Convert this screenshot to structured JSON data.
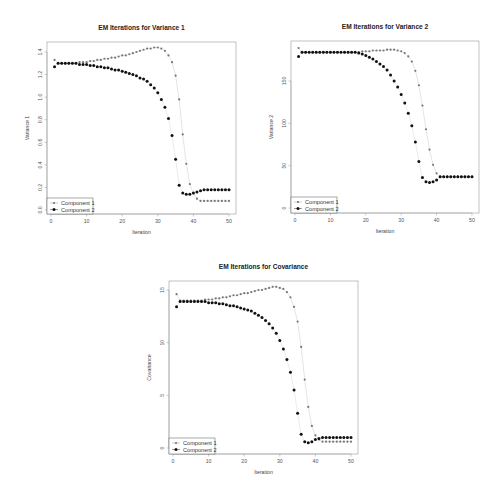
{
  "page": {
    "corner_mark": ""
  },
  "chart_data": [
    {
      "id": "variance1",
      "type": "scatter",
      "title": "EM Iterations for Variance 1",
      "xlabel": "Iteration",
      "ylabel": "Variance 1",
      "xlim": [
        0,
        50
      ],
      "ylim": [
        0.0,
        1.45
      ],
      "xticks": [
        0,
        10,
        20,
        30,
        40,
        50
      ],
      "yticks": [
        0.0,
        0.2,
        0.4,
        0.6,
        0.8,
        1.0,
        1.2,
        1.4
      ],
      "ytick_labels": [
        "0.0",
        "0.2",
        "0.4",
        "0.6",
        "0.8",
        "1.0",
        "1.2",
        "1.4"
      ],
      "grid": false,
      "legend_position": "bottom-left",
      "x": [
        1,
        2,
        3,
        4,
        5,
        6,
        7,
        8,
        9,
        10,
        11,
        12,
        13,
        14,
        15,
        16,
        17,
        18,
        19,
        20,
        21,
        22,
        23,
        24,
        25,
        26,
        27,
        28,
        29,
        30,
        31,
        32,
        33,
        34,
        35,
        36,
        37,
        38,
        39,
        40,
        41,
        42,
        43,
        44,
        45,
        46,
        47,
        48,
        49,
        50
      ],
      "series": [
        {
          "name": "Component 1",
          "color": "#777777",
          "marker_size": 1.1,
          "values": [
            1.33,
            1.3,
            1.3,
            1.3,
            1.3,
            1.3,
            1.3,
            1.31,
            1.31,
            1.31,
            1.32,
            1.32,
            1.33,
            1.33,
            1.34,
            1.34,
            1.35,
            1.35,
            1.36,
            1.37,
            1.37,
            1.38,
            1.39,
            1.4,
            1.41,
            1.42,
            1.43,
            1.43,
            1.44,
            1.44,
            1.43,
            1.41,
            1.37,
            1.31,
            1.19,
            0.98,
            0.67,
            0.41,
            0.23,
            0.15,
            0.1,
            0.08,
            0.08,
            0.08,
            0.08,
            0.08,
            0.08,
            0.08,
            0.08,
            0.08
          ]
        },
        {
          "name": "Component 2",
          "color": "#111111",
          "marker_size": 1.5,
          "values": [
            1.27,
            1.3,
            1.3,
            1.3,
            1.3,
            1.3,
            1.3,
            1.29,
            1.29,
            1.29,
            1.28,
            1.28,
            1.27,
            1.27,
            1.26,
            1.26,
            1.25,
            1.24,
            1.24,
            1.23,
            1.22,
            1.21,
            1.2,
            1.19,
            1.17,
            1.16,
            1.14,
            1.11,
            1.08,
            1.04,
            0.98,
            0.91,
            0.81,
            0.66,
            0.45,
            0.22,
            0.15,
            0.14,
            0.14,
            0.15,
            0.16,
            0.17,
            0.18,
            0.18,
            0.18,
            0.18,
            0.18,
            0.18,
            0.18,
            0.18
          ]
        }
      ]
    },
    {
      "id": "variance2",
      "type": "scatter",
      "title": "EM Iterations for Variance 2",
      "xlabel": "Iteration",
      "ylabel": "Variance 2",
      "xlim": [
        0,
        50
      ],
      "ylim": [
        0,
        190
      ],
      "xticks": [
        0,
        10,
        20,
        30,
        40,
        50
      ],
      "yticks": [
        0,
        50,
        100,
        150
      ],
      "ytick_labels": [
        "0",
        "50",
        "100",
        "150"
      ],
      "grid": false,
      "legend_position": "bottom-left",
      "x": [
        1,
        2,
        3,
        4,
        5,
        6,
        7,
        8,
        9,
        10,
        11,
        12,
        13,
        14,
        15,
        16,
        17,
        18,
        19,
        20,
        21,
        22,
        23,
        24,
        25,
        26,
        27,
        28,
        29,
        30,
        31,
        32,
        33,
        34,
        35,
        36,
        37,
        38,
        39,
        40,
        41,
        42,
        43,
        44,
        45,
        46,
        47,
        48,
        49,
        50
      ],
      "series": [
        {
          "name": "Component 1",
          "color": "#777777",
          "marker_size": 1.1,
          "values": [
            189,
            184,
            184,
            184,
            184,
            184,
            184,
            184,
            184,
            184,
            184,
            184,
            184,
            184,
            184,
            184,
            184,
            184,
            185,
            185,
            185,
            186,
            186,
            186,
            186,
            187,
            187,
            187,
            186,
            185,
            183,
            179,
            173,
            162,
            145,
            121,
            93,
            69,
            51,
            41,
            37,
            37,
            37,
            37,
            37,
            37,
            37,
            37,
            37,
            37
          ]
        },
        {
          "name": "Component 2",
          "color": "#111111",
          "marker_size": 1.5,
          "values": [
            179,
            184,
            184,
            184,
            184,
            184,
            184,
            184,
            184,
            184,
            184,
            184,
            184,
            184,
            184,
            184,
            184,
            183,
            182,
            180,
            178,
            176,
            173,
            170,
            167,
            163,
            157,
            150,
            143,
            134,
            124,
            112,
            97,
            78,
            55,
            36,
            31,
            30,
            31,
            33,
            37,
            37,
            37,
            37,
            37,
            37,
            37,
            37,
            37,
            37
          ]
        }
      ]
    },
    {
      "id": "covariance",
      "type": "scatter",
      "title": "EM Iterations for Covariance",
      "xlabel": "Iteration",
      "ylabel": "Covariance",
      "xlim": [
        0,
        50
      ],
      "ylim": [
        0,
        15.3
      ],
      "xticks": [
        0,
        10,
        20,
        30,
        40,
        50
      ],
      "yticks": [
        0,
        5,
        10,
        15
      ],
      "ytick_labels": [
        "0",
        "5",
        "10",
        "15"
      ],
      "grid": false,
      "legend_position": "bottom-left",
      "x": [
        1,
        2,
        3,
        4,
        5,
        6,
        7,
        8,
        9,
        10,
        11,
        12,
        13,
        14,
        15,
        16,
        17,
        18,
        19,
        20,
        21,
        22,
        23,
        24,
        25,
        26,
        27,
        28,
        29,
        30,
        31,
        32,
        33,
        34,
        35,
        36,
        37,
        38,
        39,
        40,
        41,
        42,
        43,
        44,
        45,
        46,
        47,
        48,
        49,
        50
      ],
      "series": [
        {
          "name": "Component 1",
          "color": "#777777",
          "marker_size": 1.1,
          "values": [
            14.6,
            14.0,
            14.0,
            14.0,
            14.0,
            14.0,
            14.0,
            14.0,
            14.1,
            14.1,
            14.1,
            14.2,
            14.2,
            14.3,
            14.3,
            14.4,
            14.5,
            14.5,
            14.6,
            14.7,
            14.7,
            14.8,
            14.9,
            15.0,
            15.0,
            15.1,
            15.2,
            15.3,
            15.3,
            15.2,
            15.1,
            14.8,
            14.3,
            13.4,
            12.0,
            9.6,
            6.5,
            3.9,
            2.1,
            1.2,
            0.8,
            0.6,
            0.6,
            0.6,
            0.6,
            0.6,
            0.6,
            0.6,
            0.6,
            0.6
          ]
        },
        {
          "name": "Component 2",
          "color": "#111111",
          "marker_size": 1.5,
          "values": [
            13.4,
            13.9,
            13.9,
            13.9,
            13.9,
            13.9,
            13.9,
            13.9,
            13.9,
            13.8,
            13.8,
            13.8,
            13.7,
            13.7,
            13.6,
            13.5,
            13.5,
            13.4,
            13.3,
            13.2,
            13.1,
            13.0,
            12.8,
            12.6,
            12.4,
            12.1,
            11.8,
            11.4,
            10.9,
            10.2,
            9.4,
            8.4,
            7.2,
            5.5,
            3.3,
            1.3,
            0.6,
            0.5,
            0.6,
            0.8,
            0.9,
            1.0,
            1.0,
            1.0,
            1.0,
            1.0,
            1.0,
            1.0,
            1.0,
            1.0
          ]
        }
      ]
    }
  ],
  "layout": [
    {
      "chart": 0,
      "left": 47,
      "top": 42,
      "right": 236,
      "bottom": 214,
      "x0": 51,
      "x50": 229,
      "ybase_val": 0.0,
      "ybase_px": 210,
      "ytop_val": 1.4,
      "ytop_px": 52
    },
    {
      "chart": 1,
      "left": 291,
      "top": 41,
      "right": 479,
      "bottom": 213,
      "x0": 295,
      "x50": 472,
      "ybase_val": 0,
      "ybase_px": 208,
      "ytop_val": 150,
      "ytop_px": 81
    },
    {
      "chart": 2,
      "left": 169,
      "top": 281,
      "right": 358,
      "bottom": 454,
      "x0": 173,
      "x50": 351,
      "ybase_val": 0,
      "ybase_px": 448,
      "ytop_val": 15,
      "ytop_px": 290
    }
  ]
}
